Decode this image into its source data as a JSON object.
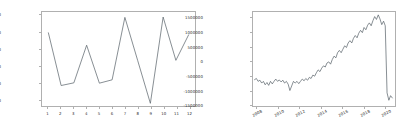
{
  "figure": {
    "background_color": "#ffffff",
    "line_color": "#555f66",
    "frame_color": "#b0b0b0",
    "tick_label_color": "#2b2b2b"
  },
  "chart_data": [
    {
      "type": "line",
      "title": "",
      "xlabel": "",
      "ylabel": "",
      "panel": "left",
      "grid": false,
      "legend": false,
      "xlim": [
        0.5,
        12.5
      ],
      "ylim": [
        1180000,
        1460000
      ],
      "xticks": [
        1,
        2,
        3,
        4,
        5,
        6,
        7,
        8,
        9,
        10,
        11,
        12
      ],
      "xtick_labels": [
        "1",
        "2",
        "3",
        "4",
        "5",
        "6",
        "7",
        "8",
        "9",
        "10",
        "11",
        "12"
      ],
      "yticks": [
        1200000,
        1250000,
        1300000,
        1350000,
        1400000,
        1450000
      ],
      "ytick_labels": [
        "1200000",
        "1250000",
        "1300000",
        "1350000",
        "1400000",
        "1450000"
      ],
      "x": [
        1,
        2,
        3,
        4,
        5,
        6,
        7,
        8,
        9,
        10,
        11,
        12
      ],
      "values": [
        1398000,
        1241000,
        1249000,
        1361000,
        1248000,
        1258000,
        1444000,
        1316000,
        1188000,
        1445000,
        1316000,
        1392000
      ]
    },
    {
      "type": "line",
      "title": "",
      "xlabel": "",
      "ylabel": "",
      "panel": "right",
      "grid": false,
      "legend": false,
      "xlim": [
        2007.6,
        2021.0
      ],
      "ylim": [
        -1560000,
        1720000
      ],
      "xticks": [
        2008,
        2010,
        2012,
        2014,
        2016,
        2018,
        2020
      ],
      "xtick_labels": [
        "2008",
        "2010",
        "2012",
        "2014",
        "2016",
        "2018",
        "2020"
      ],
      "yticks": [
        -1500000,
        -1000000,
        -500000,
        0,
        500000,
        1000000,
        1500000
      ],
      "ytick_labels": [
        "-1500000",
        "-1000000",
        "-500000",
        "0",
        "500000",
        "1000000",
        "1500000"
      ],
      "x": [
        2007.75,
        2007.92,
        2008.08,
        2008.25,
        2008.42,
        2008.58,
        2008.75,
        2008.92,
        2009.08,
        2009.25,
        2009.42,
        2009.58,
        2009.75,
        2009.92,
        2010.08,
        2010.25,
        2010.42,
        2010.58,
        2010.75,
        2010.92,
        2011.08,
        2011.25,
        2011.42,
        2011.58,
        2011.75,
        2011.92,
        2012.08,
        2012.25,
        2012.42,
        2012.58,
        2012.75,
        2012.92,
        2013.08,
        2013.25,
        2013.42,
        2013.58,
        2013.75,
        2013.92,
        2014.08,
        2014.25,
        2014.42,
        2014.58,
        2014.75,
        2014.92,
        2015.08,
        2015.25,
        2015.42,
        2015.58,
        2015.75,
        2015.92,
        2016.08,
        2016.25,
        2016.42,
        2016.58,
        2016.75,
        2016.92,
        2017.08,
        2017.25,
        2017.42,
        2017.58,
        2017.75,
        2017.92,
        2018.08,
        2018.25,
        2018.42,
        2018.58,
        2018.75,
        2018.92,
        2019.08,
        2019.25,
        2019.42,
        2019.58,
        2019.75,
        2019.92,
        2020.08,
        2020.25,
        2020.42,
        2020.58,
        2020.75
      ],
      "values": [
        -640000,
        -600000,
        -700000,
        -660000,
        -760000,
        -700000,
        -820000,
        -740000,
        -840000,
        -700000,
        -790000,
        -700000,
        -620000,
        -700000,
        -650000,
        -720000,
        -660000,
        -760000,
        -700000,
        -800000,
        -1020000,
        -860000,
        -700000,
        -760000,
        -700000,
        -780000,
        -700000,
        -620000,
        -680000,
        -600000,
        -660000,
        -560000,
        -600000,
        -480000,
        -520000,
        -400000,
        -300000,
        -360000,
        -240000,
        -160000,
        -200000,
        -60000,
        -20000,
        -100000,
        60000,
        180000,
        120000,
        300000,
        380000,
        300000,
        420000,
        540000,
        480000,
        640000,
        720000,
        640000,
        800000,
        900000,
        820000,
        980000,
        1080000,
        1000000,
        1180000,
        1100000,
        1260000,
        1340000,
        1240000,
        1420000,
        1560000,
        1460000,
        1620000,
        1480000,
        1280000,
        1400000,
        1240000,
        -1100000,
        -1360000,
        -1200000,
        -1280000
      ]
    }
  ]
}
